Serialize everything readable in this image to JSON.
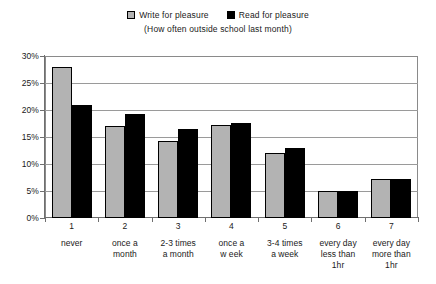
{
  "chart_data": {
    "type": "bar",
    "title": "",
    "subtitle": "(How often outside school last month)",
    "xlabel": "",
    "ylabel": "",
    "ylim": [
      0,
      30
    ],
    "ytick_labels": [
      "30%",
      "25%",
      "20%",
      "15%",
      "10%",
      "5%",
      "0%"
    ],
    "ytick_values": [
      30,
      25,
      20,
      15,
      10,
      5,
      0
    ],
    "grid": true,
    "legend_position": "top-center",
    "categories": [
      "1",
      "2",
      "3",
      "4",
      "5",
      "6",
      "7"
    ],
    "category_labels": [
      "never",
      "once a\nmonth",
      "2-3 times\na month",
      "once a\nw eek",
      "3-4 times\na week",
      "every day\nless than\n1hr",
      "every day\nmore than\n1hr"
    ],
    "series": [
      {
        "name": "Write for pleasure",
        "color": "#b3b3b3",
        "values": [
          28.0,
          17.0,
          14.3,
          17.3,
          12.0,
          5.0,
          7.3
        ]
      },
      {
        "name": "Read for pleasure",
        "color": "#000000",
        "values": [
          21.0,
          19.3,
          16.5,
          17.6,
          13.0,
          5.0,
          7.3
        ]
      }
    ]
  },
  "legend": {
    "items": [
      {
        "label": "Write for pleasure",
        "swatch": "#b3b3b3"
      },
      {
        "label": "Read for pleasure",
        "swatch": "#000000"
      }
    ]
  }
}
